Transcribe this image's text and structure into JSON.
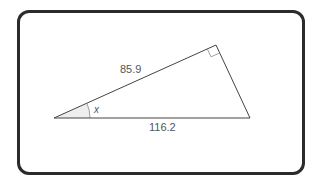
{
  "diagram": {
    "type": "right-triangle",
    "labels": {
      "side_upper": "85.9",
      "side_base": "116.2",
      "angle": "x"
    },
    "vertices": {
      "left": [
        54,
        118
      ],
      "top_right_angle": [
        216,
        45
      ],
      "bottom_right": [
        250,
        118
      ]
    },
    "right_angle_marker": "top_right_angle",
    "colors": {
      "frame_border": "#2b2b2b",
      "lines": "#444444",
      "label_text": "#555555",
      "angle_fill": "#eeeeee"
    }
  }
}
